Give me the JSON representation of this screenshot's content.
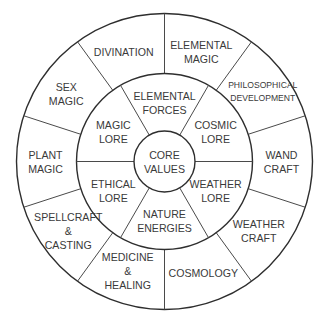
{
  "diagram": {
    "center_label": [
      "CORE",
      "VALUES"
    ],
    "middle_ring": [
      {
        "lines": [
          "ELEMENTAL",
          "FORCES"
        ],
        "angle": 90
      },
      {
        "lines": [
          "COSMIC",
          "LORE"
        ],
        "angle": 30
      },
      {
        "lines": [
          "WEATHER",
          "LORE"
        ],
        "angle": -30
      },
      {
        "lines": [
          "NATURE",
          "ENERGIES"
        ],
        "angle": -90
      },
      {
        "lines": [
          "ETHICAL",
          "LORE"
        ],
        "angle": -150
      },
      {
        "lines": [
          "MAGIC",
          "LORE"
        ],
        "angle": 150
      }
    ],
    "outer_ring": [
      {
        "lines": [
          "ELEMENTAL",
          "MAGIC"
        ],
        "angle": 72
      },
      {
        "lines": [
          "PHILOSOPHICAL",
          "DEVELOPMENT"
        ],
        "angle": 36
      },
      {
        "lines": [
          "WAND",
          "CRAFT"
        ],
        "angle": 0
      },
      {
        "lines": [
          "WEATHER",
          "CRAFT"
        ],
        "angle": -36
      },
      {
        "lines": [
          "COSMOLOGY"
        ],
        "angle": -72
      },
      {
        "lines": [
          "MEDICINE",
          "&",
          "HEALING"
        ],
        "angle": -108
      },
      {
        "lines": [
          "SPELLCRAFT",
          "&",
          "CASTING"
        ],
        "angle": -144
      },
      {
        "lines": [
          "PLANT",
          "MAGIC"
        ],
        "angle": 180
      },
      {
        "lines": [
          "SEX",
          "MAGIC"
        ],
        "angle": 144
      },
      {
        "lines": [
          "DIVINATION"
        ],
        "angle": 108
      }
    ],
    "colors": {
      "line": "#2e2e2e",
      "text": "#3a3a3a",
      "fill": "#ffffff"
    }
  }
}
